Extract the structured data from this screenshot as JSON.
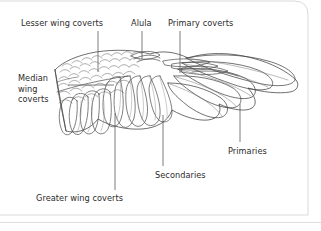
{
  "figure": {
    "title_visible": false,
    "background_color": "#ffffff",
    "line_color": "#3a3a3a",
    "text_color": "#2b2b2b",
    "border_color": "#d8d8d8",
    "labels": [
      {
        "id": "lesser",
        "text": "Lesser wing coverts"
      },
      {
        "id": "alula",
        "text": "Alula"
      },
      {
        "id": "primcov",
        "text": "Primary coverts"
      },
      {
        "id": "median",
        "text": "Median\nwing\ncoverts"
      },
      {
        "id": "primaries",
        "text": "Primaries"
      },
      {
        "id": "second",
        "text": "Secondaries"
      },
      {
        "id": "greater",
        "text": "Greater wing coverts"
      }
    ]
  }
}
